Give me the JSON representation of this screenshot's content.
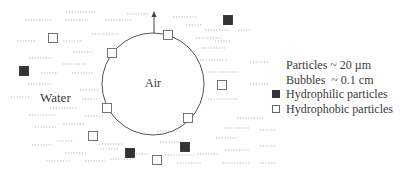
{
  "diagram": {
    "regions": {
      "bubble_label": "Air",
      "medium_label": "Water"
    },
    "bubble": {
      "cx": 153,
      "cy": 84,
      "r": 51,
      "stroke": "#555555"
    },
    "arrow": {
      "x": 154,
      "y_from": 33,
      "y_to": 11,
      "meaning": "bubble rising direction"
    },
    "hydrophobic_particles": [
      {
        "x": 53,
        "y": 38
      },
      {
        "x": 112,
        "y": 53
      },
      {
        "x": 168,
        "y": 35
      },
      {
        "x": 107,
        "y": 108
      },
      {
        "x": 188,
        "y": 118
      },
      {
        "x": 93,
        "y": 136
      },
      {
        "x": 222,
        "y": 85
      },
      {
        "x": 157,
        "y": 160
      }
    ],
    "hydrophilic_particles": [
      {
        "x": 228,
        "y": 20
      },
      {
        "x": 24,
        "y": 71
      },
      {
        "x": 130,
        "y": 153
      },
      {
        "x": 185,
        "y": 147
      }
    ],
    "colors": {
      "filled": "#333333",
      "outline": "#666666",
      "dashes": "#9a9a9a"
    }
  },
  "legend": {
    "scale_particles": "Particles ~ 20 µm",
    "scale_bubbles": "Bubbles  ~ 0.1 cm",
    "items": [
      {
        "symbol": "filled-square",
        "label": "Hydrophilic particles"
      },
      {
        "symbol": "empty-square",
        "label": "Hydrophobic particles"
      }
    ]
  }
}
